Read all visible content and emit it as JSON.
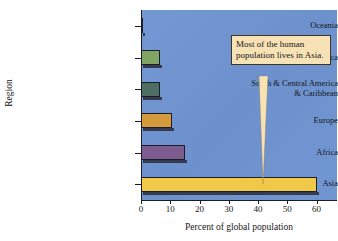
{
  "chart_data": {
    "type": "bar",
    "orientation": "horizontal",
    "title": "",
    "xlabel": "Percent of global population",
    "ylabel": "Region",
    "categories": [
      "Asia",
      "Africa",
      "Europe",
      "South & Central America & Caribbean",
      "North America",
      "Oceania"
    ],
    "category_labels": [
      {
        "line1": "Asia",
        "line2": ""
      },
      {
        "line1": "Africa",
        "line2": ""
      },
      {
        "line1": "Europe",
        "line2": ""
      },
      {
        "line1": "South & Central America",
        "line2": "& Caribbean"
      },
      {
        "line1": "North America",
        "line2": ""
      },
      {
        "line1": "Oceania",
        "line2": ""
      }
    ],
    "values": [
      60,
      15,
      10.5,
      6.5,
      6.5,
      0.5
    ],
    "bar_colors": [
      "#f0c948",
      "#7d5d8f",
      "#d49a3c",
      "#4c6e63",
      "#7fa463",
      "#c07a48"
    ],
    "xlim": [
      0,
      67
    ],
    "xticks": [
      0,
      10,
      20,
      30,
      40,
      50,
      60
    ],
    "xtick_labels": [
      "0",
      "10",
      "20",
      "30",
      "40",
      "50",
      "60"
    ],
    "grid": false,
    "legend": "none",
    "plot_background_color": "#6f94cf",
    "annotations": [
      {
        "text": "Most of the human population lives in Asia.",
        "points_to": "Asia",
        "background_color": "#f6e2b4",
        "border_color": "#403525"
      }
    ]
  }
}
